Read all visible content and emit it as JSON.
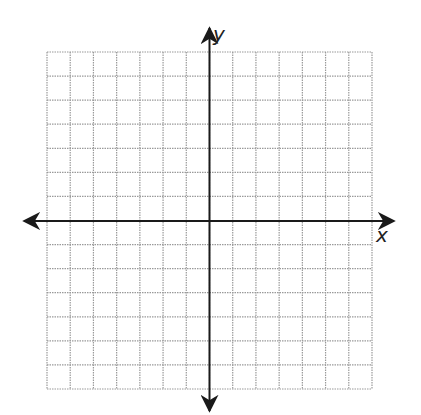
{
  "diagram": {
    "type": "coordinate-plane",
    "axes": {
      "x_label": "x",
      "y_label": "y",
      "arrows": "both-ends"
    },
    "grid": {
      "columns": 14,
      "rows": 14,
      "columns_left_of_y_axis": 7,
      "columns_right_of_y_axis": 7,
      "rows_above_x_axis": 7,
      "rows_below_x_axis": 7,
      "line_style": "dotted",
      "line_color": "#9a9a9a"
    },
    "axis_color": "#1a1a1a",
    "background": "#ffffff"
  }
}
